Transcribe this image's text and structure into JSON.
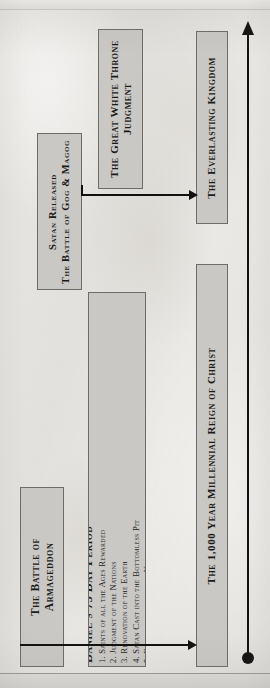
{
  "diagram": {
    "orientation": "rotated-90-ccw",
    "paper_color": "#e9e7e3",
    "box_fill": "#cac8c5",
    "box_border": "#6e6c69",
    "line_color": "#121110"
  },
  "events": {
    "armageddon": {
      "line1": "The Battle of",
      "line2": "Armageddon"
    },
    "daniel": {
      "heading": "Daniel's 75 Day Period",
      "items": [
        "1. Saints of all the Ages Rewarded",
        "2. Judgment of the Nations",
        "3. Renovation of the Earth",
        "4. Satan Cast into the Bottomless Pit",
        "5. Establishment of the Kingdom"
      ]
    },
    "satan_released": {
      "line1": "Satan Released",
      "line2": "The Battle of Gog & Magog"
    },
    "great_white_throne": {
      "line1": "The Great White Throne",
      "line2": "Judgment"
    }
  },
  "eras": {
    "millennial": {
      "label": "The 1,000 Year Millennial Reign of Christ"
    },
    "everlasting": {
      "label": "The Everlasting Kingdom"
    }
  },
  "connectors": {
    "bottom_arrow": "arrow-right",
    "middle_arrow": "arrow-right",
    "axis_arrow": "arrow-up",
    "axis_start_marker": "filled-circle"
  }
}
